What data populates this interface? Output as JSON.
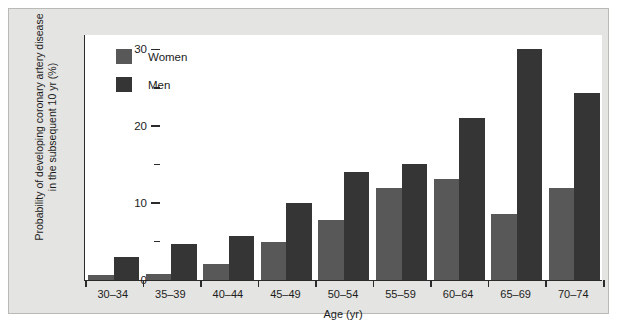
{
  "chart_data": {
    "type": "bar",
    "title": "",
    "xlabel": "Age (yr)",
    "ylabel": "Probability of developing coronary artery disease in the subsequent 10 yr (%)",
    "ylabel_line1": "Probability of developing coronary artery disease",
    "ylabel_line2": "in the subsequent 10 yr (%)",
    "ylim": [
      0,
      32
    ],
    "y_major_ticks": [
      0,
      10,
      20,
      30
    ],
    "y_minor_ticks": [
      5,
      15,
      25
    ],
    "y_tick_labels": [
      "0",
      "10",
      "20",
      "30"
    ],
    "grid": false,
    "legend_position": "top-left",
    "categories": [
      "30–34",
      "35–39",
      "40–44",
      "45–49",
      "50–54",
      "55–59",
      "60–64",
      "65–69",
      "70–74"
    ],
    "series": [
      {
        "name": "Women",
        "color": "#585858",
        "values": [
          0.7,
          0.8,
          2.1,
          4.9,
          7.8,
          12.0,
          13.1,
          8.6,
          12.0
        ]
      },
      {
        "name": "Men",
        "color": "#353535",
        "values": [
          3.0,
          4.7,
          5.7,
          10.0,
          14.1,
          15.1,
          21.1,
          30.0,
          24.3
        ]
      }
    ]
  },
  "legend": {
    "items": [
      {
        "label": "Women",
        "key": "women"
      },
      {
        "label": "Men",
        "key": "men"
      }
    ]
  },
  "colors": {
    "women": "#585858",
    "men": "#353535",
    "panel_background": "#e4e4e2",
    "plot_background": "#ffffff",
    "axis": "#2b2b2b",
    "text": "#1c1c1c"
  }
}
